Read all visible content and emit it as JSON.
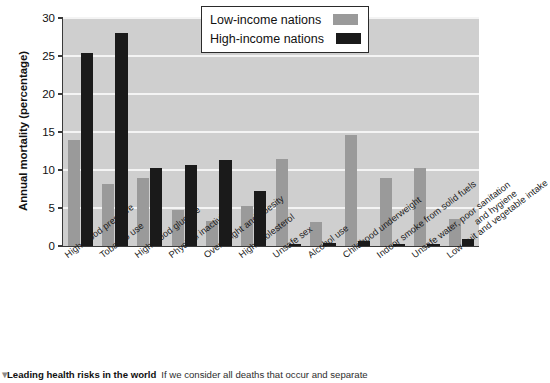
{
  "chart_data": {
    "type": "bar",
    "title": "",
    "xlabel": "",
    "ylabel": "Annual mortality (percentage)",
    "ylim": [
      0,
      30
    ],
    "yticks": [
      0,
      5,
      10,
      15,
      20,
      25,
      30
    ],
    "grid": true,
    "legend_position": "top-right",
    "categories": [
      "High blood pressure",
      "Tobacco use",
      "High blood glucose",
      "Physical inactivity",
      "Overweight and obesity",
      "High cholesterol",
      "Unsafe sex",
      "Alcohol use",
      "Childhood underweight",
      "Indoor smoke from solid fuels",
      "Unsafe water, poor sanitation\nand hygiene",
      "Low fruit and vegetable intake"
    ],
    "series": [
      {
        "name": "Low-income nations",
        "color": "#9a9a9a",
        "values": [
          14.0,
          8.2,
          9.0,
          4.7,
          3.3,
          5.2,
          11.5,
          3.2,
          14.6,
          9.0,
          10.3,
          3.5
        ]
      },
      {
        "name": "High-income nations",
        "color": "#1a1a1a",
        "values": [
          25.4,
          28.0,
          10.3,
          10.7,
          11.3,
          7.3,
          0.3,
          0.4,
          0.7,
          0.2,
          0.2,
          0.9
        ]
      }
    ]
  },
  "legend": {
    "items": [
      {
        "label": "Low-income nations",
        "swatch": "low"
      },
      {
        "label": "High-income nations",
        "swatch": "high"
      }
    ]
  },
  "caption": {
    "marker": "▼",
    "title": "Leading health risks in the world",
    "body": "If we consider all deaths that occur and separate"
  }
}
